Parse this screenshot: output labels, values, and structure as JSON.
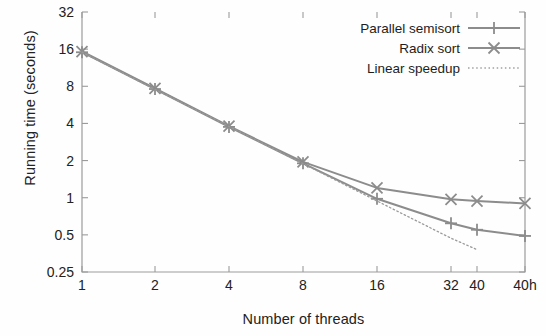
{
  "chart_data": {
    "type": "line",
    "title": "",
    "xlabel": "Number of threads",
    "ylabel": "Running time (seconds)",
    "x_scale": "log2-categorical",
    "y_scale": "log2",
    "grid": false,
    "legend_position": "top-right",
    "x_tick_labels": [
      "1",
      "2",
      "4",
      "8",
      "16",
      "32",
      "40",
      "40h"
    ],
    "y_tick_labels": [
      "0.25",
      "0.5",
      "1",
      "2",
      "4",
      "8",
      "16",
      "32"
    ],
    "ylim": [
      0.25,
      32
    ],
    "categories": [
      "1",
      "2",
      "4",
      "8",
      "16",
      "32",
      "40",
      "40h"
    ],
    "series": [
      {
        "name": "Parallel semisort",
        "marker": "plus",
        "linestyle": "solid",
        "color": "#8c8c8c",
        "values": [
          15.1,
          7.6,
          3.75,
          1.9,
          0.98,
          0.62,
          0.55,
          0.49
        ]
      },
      {
        "name": "Radix sort",
        "marker": "cross",
        "linestyle": "solid",
        "color": "#8c8c8c",
        "values": [
          15.3,
          7.7,
          3.8,
          1.95,
          1.2,
          0.97,
          0.94,
          0.9
        ]
      },
      {
        "name": "Linear speedup",
        "marker": "none",
        "linestyle": "dotted",
        "color": "#9a9a9a",
        "values": [
          15.1,
          7.55,
          3.78,
          1.89,
          0.94,
          0.47,
          0.38,
          null
        ]
      }
    ]
  },
  "legend": {
    "items": [
      {
        "label": "Parallel semisort",
        "marker": "plus",
        "style": "solid"
      },
      {
        "label": "Radix sort",
        "marker": "cross",
        "style": "solid"
      },
      {
        "label": "Linear speedup",
        "marker": "none",
        "style": "dotted"
      }
    ]
  },
  "colors": {
    "line": "#8c8c8c",
    "dotted": "#a0a0a0",
    "axis": "#9b9b9b",
    "text": "#222222",
    "background": "#fefefe"
  }
}
